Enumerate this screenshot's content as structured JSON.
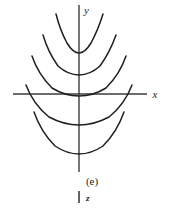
{
  "figure": {
    "caption": "(e)",
    "stray_label": "z",
    "axes": {
      "x_label": "x",
      "y_label": "y",
      "x_axis": {
        "x1": 13,
        "y1": 94,
        "x2": 147,
        "y2": 94
      },
      "y_axis": {
        "x1": 79,
        "y1": 5,
        "x2": 79,
        "y2": 172
      }
    },
    "tick": {
      "x1": 79,
      "y1": 191,
      "x2": 79,
      "y2": 203
    },
    "label_positions": {
      "x": {
        "x": 155,
        "y": 98
      },
      "y": {
        "x": 84,
        "y": 14
      },
      "caption": {
        "x": 85,
        "y": 182
      },
      "stray": {
        "x": 86,
        "y": 201
      }
    },
    "colors": {
      "background": "#ffffff",
      "ink": "#231f20",
      "axis": "#3b3b3b"
    }
  },
  "chart_data": {
    "type": "line",
    "title": "(e)",
    "xlabel": "x",
    "ylabel": "y",
    "grid": false,
    "legend": null,
    "axis_origin_px": {
      "x": 79,
      "y": 94
    },
    "xlim": [
      -66,
      68
    ],
    "ylim": [
      -78,
      89
    ],
    "series": [
      {
        "name": "parabola-1",
        "vertex_px": {
          "x": 79,
          "y": 52
        },
        "path": "M 56 14 Q 60 30 67 43 Q 73 53 79 53 Q 85 53 91 43 Q 98 30 103 14"
      },
      {
        "name": "parabola-2",
        "vertex_px": {
          "x": 79,
          "y": 73
        },
        "path": "M 43 35 Q 48 52 58 66 Q 68 75 79 75 Q 90 75 100 66 Q 110 52 116 35"
      },
      {
        "name": "parabola-3",
        "vertex_px": {
          "x": 79,
          "y": 94
        },
        "path": "M 32 56 Q 38 74 52 88 Q 65 96 79 96 Q 93 96 106 88 Q 120 74 126 56"
      },
      {
        "name": "parabola-4",
        "vertex_px": {
          "x": 79,
          "y": 122
        },
        "path": "M 26 85 Q 33 104 49 117 Q 64 125 79 125 Q 94 125 109 117 Q 125 104 132 85"
      },
      {
        "name": "parabola-5",
        "vertex_px": {
          "x": 79,
          "y": 150
        },
        "path": "M 34 112 Q 41 132 55 146 Q 67 154 79 154 Q 91 154 103 146 Q 117 132 124 112"
      }
    ]
  }
}
